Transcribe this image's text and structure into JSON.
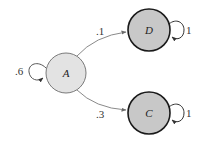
{
  "diagram": {
    "type": "markov-chain-state-diagram",
    "colors": {
      "transient_fill": "#e3e3e3",
      "transient_stroke": "#7a7a7a",
      "absorbing_fill": "#c8c8c8",
      "absorbing_stroke": "#1a1a1a",
      "edge": "#8a8a8a"
    },
    "nodes": [
      {
        "id": "A",
        "label": "A",
        "kind": "transient",
        "cx": 66,
        "cy": 73,
        "r": 20
      },
      {
        "id": "D",
        "label": "D",
        "kind": "absorbing",
        "cx": 149,
        "cy": 30,
        "r": 21
      },
      {
        "id": "C",
        "label": "C",
        "kind": "absorbing",
        "cx": 149,
        "cy": 113,
        "r": 21
      }
    ],
    "edges": [
      {
        "from": "A",
        "to": "D",
        "label": ".1"
      },
      {
        "from": "A",
        "to": "C",
        "label": ".3"
      },
      {
        "from": "A",
        "to": "A",
        "label": ".6"
      },
      {
        "from": "D",
        "to": "D",
        "label": "1"
      },
      {
        "from": "C",
        "to": "C",
        "label": "1"
      }
    ]
  }
}
